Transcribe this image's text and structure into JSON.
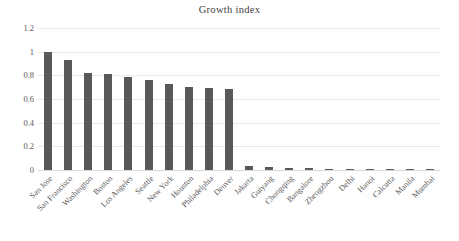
{
  "chart_data": {
    "type": "bar",
    "title": "Growth index",
    "xlabel": "",
    "ylabel": "",
    "ylim": [
      0,
      1.2
    ],
    "yticks": [
      "0",
      "0.2",
      "0.4",
      "0.6",
      "0.8",
      "1",
      "1.2"
    ],
    "ytick_values": [
      0,
      0.2,
      0.4,
      0.6,
      0.8,
      1,
      1.2
    ],
    "grid": true,
    "legend": false,
    "bar_color": "#595959",
    "gridline_color": "#e8e8e8",
    "categories": [
      "San Jose",
      "San Francisco",
      "Washington",
      "Boston",
      "Los Angeles",
      "Seattle",
      "New York",
      "Houston",
      "Philadelphia",
      "Denver",
      "Jakarta",
      "Guiyang",
      "Chongqing",
      "Bangalore",
      "Zhengzhou",
      "Delhi",
      "Hanoi",
      "Calcutta",
      "Manila",
      "Mumbai"
    ],
    "values": [
      1.0,
      0.93,
      0.82,
      0.81,
      0.79,
      0.76,
      0.73,
      0.705,
      0.695,
      0.685,
      0.03,
      0.026,
      0.018,
      0.015,
      0.012,
      0.012,
      0.008,
      0.004,
      0.002,
      0.002
    ]
  }
}
